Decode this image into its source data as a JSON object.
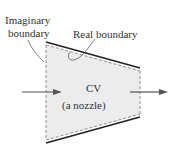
{
  "labels": {
    "imaginary_line1": "Imaginary",
    "imaginary_line2": "boundary",
    "real": "Real boundary",
    "cv": "CV",
    "cv_sub": "(a nozzle)"
  },
  "colors": {
    "fill": "#ececec",
    "line": "#222222",
    "dash": "#777777",
    "arrow": "#555555"
  }
}
